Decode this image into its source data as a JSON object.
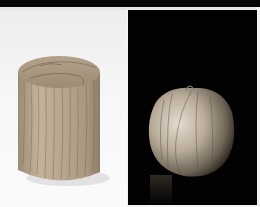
{
  "figure": {
    "panels": [
      {
        "subject": "wooden cylinder",
        "background": "light",
        "colors": {
          "background": "#f4f4f4",
          "wood": "#b9a78f"
        }
      },
      {
        "subject": "wooden apple-shaped sphere",
        "background": "dark",
        "colors": {
          "background": "#020202",
          "wood": "#b8ab98"
        }
      }
    ]
  }
}
